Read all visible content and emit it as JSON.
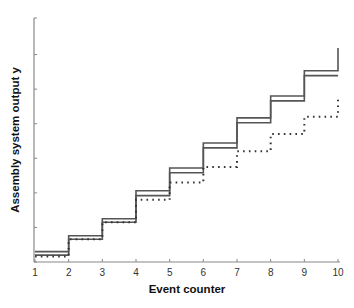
{
  "chart_data": {
    "type": "line",
    "subtype": "step",
    "title": "",
    "xlabel": "Event counter",
    "ylabel": "Assembly system output y",
    "x_ticks": [
      1,
      2,
      3,
      4,
      5,
      6,
      7,
      8,
      9,
      10
    ],
    "y_ticks_labeled": false,
    "y_tick_count": 8,
    "xlim": [
      1,
      10
    ],
    "ylim": [
      0,
      7
    ],
    "grid": false,
    "legend": null,
    "series": [
      {
        "name": "upper bound (solid, outer)",
        "style": "solid",
        "color": "#555555",
        "x": [
          1,
          2,
          3,
          4,
          5,
          6,
          7,
          8,
          9,
          10
        ],
        "values": [
          0.3,
          0.76,
          1.25,
          2.06,
          2.72,
          3.44,
          4.17,
          4.8,
          5.53,
          6.19
        ]
      },
      {
        "name": "lower bound (solid, inner)",
        "style": "solid",
        "color": "#555555",
        "x": [
          1,
          2,
          3,
          4,
          5,
          6,
          7,
          8,
          9,
          10
        ],
        "values": [
          0.2,
          0.66,
          1.15,
          1.92,
          2.58,
          3.3,
          4.03,
          4.66,
          5.39,
          5.39
        ]
      },
      {
        "name": "dotted series",
        "style": "dotted",
        "color": "#333333",
        "x": [
          1,
          2,
          3,
          4,
          5,
          6,
          7,
          8,
          9,
          10
        ],
        "values": [
          0.16,
          0.66,
          1.15,
          1.8,
          2.3,
          2.75,
          3.2,
          3.7,
          4.2,
          4.8
        ]
      }
    ]
  }
}
